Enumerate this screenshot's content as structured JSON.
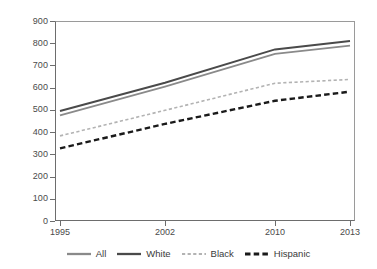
{
  "chart_data": {
    "type": "line",
    "title": "",
    "subtitle": "",
    "xlabel": "",
    "ylabel": "",
    "x": [
      "1995",
      "2002",
      "2010",
      "2013"
    ],
    "categories": [
      "1995",
      "2002",
      "2010",
      "2013"
    ],
    "ylim": [
      0,
      900
    ],
    "yticks": [
      0,
      100,
      200,
      300,
      400,
      500,
      600,
      700,
      800,
      900
    ],
    "ytick_labels": [
      "0",
      "100",
      "200",
      "300",
      "400",
      "500",
      "600",
      "700",
      "800",
      "900"
    ],
    "grid": false,
    "legend_position": "bottom",
    "series": [
      {
        "name": "All",
        "values": [
          475,
          605,
          752,
          789
        ],
        "color": "#8a8a8a",
        "style": "solid"
      },
      {
        "name": "White",
        "values": [
          495,
          622,
          772,
          810
        ],
        "color": "#4a4a4a",
        "style": "solid"
      },
      {
        "name": "Black",
        "values": [
          383,
          498,
          620,
          637
        ],
        "color": "#b3b3b3",
        "style": "dashed-fine"
      },
      {
        "name": "Hispanic",
        "values": [
          327,
          437,
          541,
          582
        ],
        "color": "#1a1a1a",
        "style": "dashed-bold"
      }
    ]
  },
  "legend": {
    "items": [
      {
        "label": "All",
        "color": "#8a8a8a",
        "style": "solid"
      },
      {
        "label": "White",
        "color": "#4a4a4a",
        "style": "solid"
      },
      {
        "label": "Black",
        "color": "#b3b3b3",
        "style": "dashed-fine"
      },
      {
        "label": "Hispanic",
        "color": "#1a1a1a",
        "style": "dashed-bold"
      }
    ]
  },
  "axes": {
    "y_axis_name": "y-axis",
    "x_axis_name": "x-axis"
  },
  "colors": {
    "axis": "#6d6d6d",
    "frame": "#9a9a9a",
    "text": "#3a3a3a",
    "background": "#ffffff"
  }
}
